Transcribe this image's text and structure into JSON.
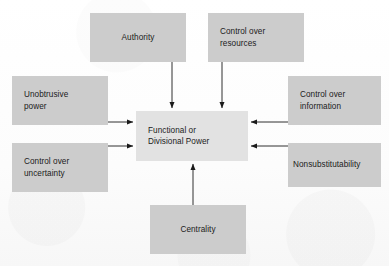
{
  "figure": {
    "kind": "concept-diagram",
    "background_color": "#fdfdfd",
    "node_color": "#cccccc",
    "center_node_color": "#e2e2e2",
    "edge_color": "#1a1a1a",
    "text_color": "#1b1b1b"
  },
  "center": {
    "id": "functional-or-divisional-power",
    "label": "Functional or\nDivisional Power"
  },
  "sources": [
    {
      "id": "authority",
      "label": "Authority",
      "position": "top-left"
    },
    {
      "id": "control-over-resources",
      "label": "Control over\nresources",
      "position": "top-right"
    },
    {
      "id": "unobtrusive-power",
      "label": "Unobtrusive\npower",
      "position": "left-upper"
    },
    {
      "id": "control-over-uncertainty",
      "label": "Control over\nuncertainty",
      "position": "left-lower"
    },
    {
      "id": "control-over-information",
      "label": "Control over\ninformation",
      "position": "right-upper"
    },
    {
      "id": "nonsubstitutability",
      "label": "Nonsubstitutability",
      "position": "right-lower"
    },
    {
      "id": "centrality",
      "label": "Centrality",
      "position": "bottom"
    }
  ],
  "edges": [
    {
      "id": "edge-authority-to-center",
      "from": "authority",
      "to": "functional-or-divisional-power",
      "direction": "down"
    },
    {
      "id": "edge-resources-to-center",
      "from": "control-over-resources",
      "to": "functional-or-divisional-power",
      "direction": "down"
    },
    {
      "id": "edge-unobtrusive-power-to-center",
      "from": "unobtrusive-power",
      "to": "functional-or-divisional-power",
      "direction": "right"
    },
    {
      "id": "edge-control-over-uncertainty-to-center",
      "from": "control-over-uncertainty",
      "to": "functional-or-divisional-power",
      "direction": "right"
    },
    {
      "id": "edge-control-over-information-to-center",
      "from": "control-over-information",
      "to": "functional-or-divisional-power",
      "direction": "left"
    },
    {
      "id": "edge-nonsubstitutability-to-center",
      "from": "nonsubstitutability",
      "to": "functional-or-divisional-power",
      "direction": "left"
    },
    {
      "id": "edge-centrality-to-center",
      "from": "centrality",
      "to": "functional-or-divisional-power",
      "direction": "up"
    }
  ]
}
